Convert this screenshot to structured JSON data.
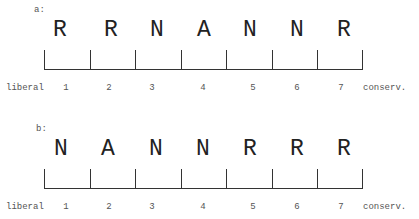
{
  "panels": [
    {
      "label": "a:",
      "letters": [
        "R",
        "R",
        "N",
        "A",
        "N",
        "N",
        "R"
      ],
      "left_label": "liberal",
      "right_label": "conserv.",
      "numbers": [
        "1",
        "2",
        "3",
        "4",
        "5",
        "6",
        "7"
      ]
    },
    {
      "label": "b:",
      "letters": [
        "N",
        "A",
        "N",
        "N",
        "R",
        "R",
        "R"
      ],
      "left_label": "liberal",
      "right_label": "conserv.",
      "numbers": [
        "1",
        "2",
        "3",
        "4",
        "5",
        "6",
        "7"
      ]
    }
  ],
  "legend_meaning": {
    "R": "R",
    "N": "N",
    "A": "A"
  },
  "colors": {
    "line": "#333333",
    "text": "#222222",
    "background": "#ffffff"
  }
}
